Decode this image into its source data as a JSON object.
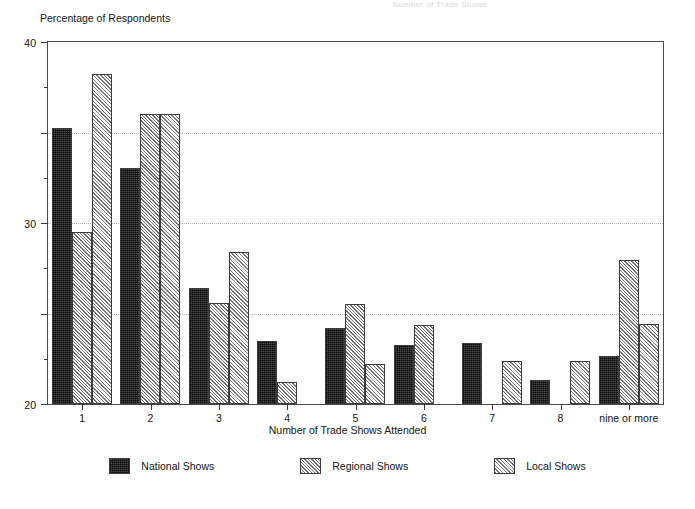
{
  "faint_title": "Number of Trade Shows",
  "axes": {
    "ylabel": "Percentage of Respondents",
    "xlabel": "Number of Trade Shows Attended",
    "ytick_labels": [
      "0",
      "10",
      "20",
      "30",
      "40"
    ]
  },
  "legend": {
    "items": [
      {
        "label": "National Shows",
        "swatch": "dark-checker-swatch",
        "color": "#4b4b4b"
      },
      {
        "label": "Regional Shows",
        "swatch": "light-diagonal-swatch",
        "color": "#6e6e6e"
      },
      {
        "label": "Local Shows",
        "swatch": "cross-diagonal-swatch",
        "color": "#8a8a8a"
      }
    ]
  },
  "chart_data": {
    "type": "bar",
    "title": "Number of Trade Shows",
    "xlabel": "Number of Trade Shows Attended",
    "ylabel": "Percentage of Respondents",
    "ylim": [
      0,
      40
    ],
    "yticks": [
      0,
      10,
      20,
      30,
      40
    ],
    "yticks_minor": [
      5,
      15,
      25,
      35
    ],
    "grid": "horizontal-dotted",
    "legend_position": "bottom-center",
    "categories": [
      "1",
      "2",
      "3",
      "4",
      "5",
      "6",
      "7",
      "8",
      "nine or more"
    ],
    "series": [
      {
        "name": "National Shows",
        "values": [
          30.5,
          26.1,
          12.8,
          7.0,
          8.4,
          6.5,
          6.7,
          2.7,
          5.3
        ]
      },
      {
        "name": "Regional Shows",
        "values": [
          19.0,
          32.1,
          11.2,
          2.4,
          11.0,
          8.7,
          0,
          0,
          15.9
        ]
      },
      {
        "name": "Local Shows",
        "values": [
          36.5,
          32.1,
          16.8,
          0,
          4.4,
          0,
          4.8,
          4.8,
          8.8
        ]
      }
    ]
  }
}
